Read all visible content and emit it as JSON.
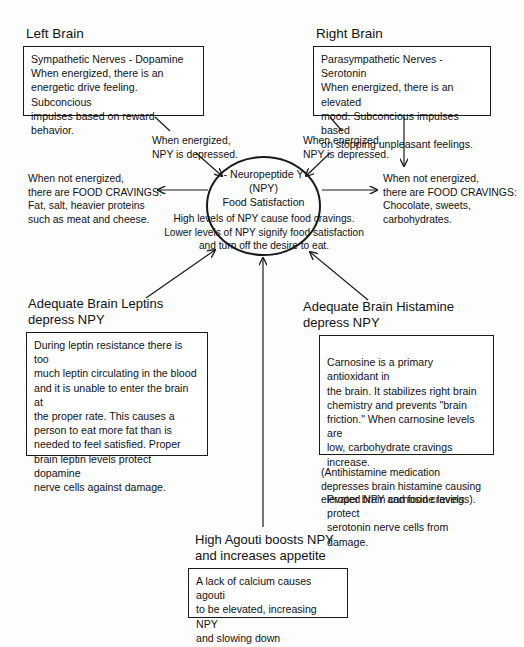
{
  "diagram": {
    "title_semantic": "npy-food-satisfaction-diagram",
    "background_color": "#fdfdfd",
    "line_color": "#1a1a1a"
  },
  "left_brain": {
    "heading": "Left Brain",
    "body": "Sympathetic Nerves - Dopamine\nWhen energized, there is an\nenergetic drive feeling.  Subconcious\nimpulses based on reward behavior."
  },
  "right_brain": {
    "heading": "Right Brain",
    "body": "Parasympathetic Nerves - Serotonin\nWhen energized, there is an elevated\nmood.  Subconcious impulses based\non stopping unpleasant feelings."
  },
  "energized_notes": {
    "left": "When energized,\nNPY is depressed.",
    "right": "When energized,\nNPY is depressed."
  },
  "cravings": {
    "left": "When not energized,\nthere are FOOD CRAVINGS:\nFat, salt, heavier proteins\nsuch as meat and cheese.",
    "right": "When not energized,\nthere are FOOD CRAVINGS:\nChocolate, sweets,\ncarbohydrates."
  },
  "center": {
    "ellipse_text": "- Neuropeptide Y\n(NPY)\nFood Satisfaction",
    "sub_text": "High levels of NPY cause food cravings.\nLower levels of NPY signify food satisfaction\nand turn off the desire to eat."
  },
  "leptins": {
    "heading": "Adequate Brain Leptins\ndepress NPY",
    "body": "During leptin resistance there is too\nmuch leptin circulating in the blood\nand it is unable to enter the brain at\nthe proper rate.  This causes a\nperson to eat more fat than is\nneeded to feel satisfied.  Proper\nbrain leptin levels protect dopamine\nnerve cells against damage."
  },
  "histamine": {
    "heading": "Adequate Brain Histamine\ndepress NPY",
    "body_part1": "Carnosine is a primary antioxidant in\nthe brain.  It stabilizes right brain\nchemistry and prevents \"brain\nfriction.\"  When carnosine levels are\nlow, carbohydrate cravings increase.",
    "body_part2": "Proper brain carnosine levels protect\nserotonin nerve cells from damage.",
    "footnote": "(Antihistamine medication\ndepresses brain histamine causing\nelevated NPY and food cravings)."
  },
  "agouti": {
    "heading": "High Agouti boosts NPY\nand increases appetite",
    "body": "A lack of calcium causes agouti\nto be elevated, increasing NPY\nand slowing down metabolism."
  }
}
